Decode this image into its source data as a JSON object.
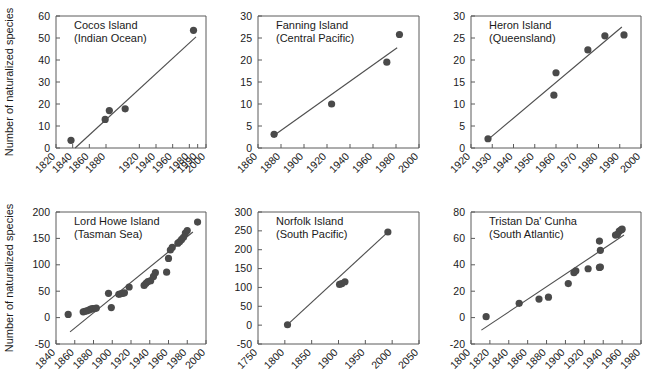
{
  "figure": {
    "shared_ylabel": "Number of naturalized species",
    "marker_color": "#4a4a4a",
    "line_color": "#4f4f4f",
    "axis_color": "#5a5a5a"
  },
  "chart_data": [
    {
      "type": "scatter",
      "panel": 1,
      "title": "Cocos Island",
      "subtitle": "(Indian Ocean)",
      "xlabel": "",
      "ylabel": "Number of naturalized species",
      "xlim": [
        1820,
        2000
      ],
      "ylim": [
        0,
        60
      ],
      "xticks": [
        1820,
        1840,
        1860,
        1880,
        1990,
        1920,
        1940,
        1960,
        1980,
        2000
      ],
      "xtick_labels": [
        "1820",
        "1840",
        "1860",
        "1880",
        "1990",
        "1920",
        "1940",
        "1960",
        "1980",
        "2000"
      ],
      "yticks": [
        0,
        10,
        20,
        30,
        40,
        50,
        60
      ],
      "ytick_labels": [
        "0",
        "10",
        "20",
        "30",
        "40",
        "50",
        "60"
      ],
      "grid": false,
      "legend": "none",
      "points": [
        {
          "x": 1838,
          "y": 3.5
        },
        {
          "x": 1879,
          "y": 13
        },
        {
          "x": 1884,
          "y": 17
        },
        {
          "x": 1903,
          "y": 17.8
        },
        {
          "x": 1985,
          "y": 53.5
        }
      ],
      "fit_line": {
        "x1": 1843,
        "y1": 0,
        "x2": 1988,
        "y2": 50.5
      }
    },
    {
      "type": "scatter",
      "panel": 2,
      "title": "Fanning Island",
      "subtitle": "(Central Pacific)",
      "xlabel": "",
      "ylabel": "",
      "xlim": [
        1860,
        2000
      ],
      "ylim": [
        0,
        30
      ],
      "xticks": [
        1860,
        1880,
        1900,
        1920,
        1940,
        1960,
        1980,
        2000
      ],
      "xtick_labels": [
        "1860",
        "1880",
        "1900",
        "1920",
        "1940",
        "1960",
        "1980",
        "2000"
      ],
      "yticks": [
        0,
        5,
        10,
        15,
        20,
        25,
        30
      ],
      "ytick_labels": [
        "0",
        "5",
        "10",
        "15",
        "20",
        "25",
        "30"
      ],
      "grid": false,
      "legend": "none",
      "points": [
        {
          "x": 1874,
          "y": 3.1
        },
        {
          "x": 1924,
          "y": 10.0
        },
        {
          "x": 1972,
          "y": 19.5
        },
        {
          "x": 1983,
          "y": 25.8
        }
      ],
      "fit_line": {
        "x1": 1872,
        "y1": 2.5,
        "x2": 1981,
        "y2": 22.8
      }
    },
    {
      "type": "scatter",
      "panel": 3,
      "title": "Heron Island",
      "subtitle": "(Queensland)",
      "xlabel": "",
      "ylabel": "",
      "xlim": [
        1920,
        2000
      ],
      "ylim": [
        0,
        30
      ],
      "xticks": [
        1920,
        1930,
        1940,
        1950,
        1960,
        1970,
        1980,
        1990,
        2000
      ],
      "xtick_labels": [
        "1920",
        "1930",
        "1940",
        "1950",
        "1960",
        "1970",
        "1980",
        "1990",
        "2000"
      ],
      "yticks": [
        0,
        5,
        10,
        15,
        20,
        25,
        30
      ],
      "ytick_labels": [
        "0",
        "5",
        "10",
        "15",
        "20",
        "25",
        "30"
      ],
      "grid": false,
      "legend": "none",
      "points": [
        {
          "x": 1928,
          "y": 2.1
        },
        {
          "x": 1959,
          "y": 12.0
        },
        {
          "x": 1960,
          "y": 17.1
        },
        {
          "x": 1975,
          "y": 22.3
        },
        {
          "x": 1983,
          "y": 25.5
        },
        {
          "x": 1992,
          "y": 25.7
        }
      ],
      "fit_line": {
        "x1": 1927,
        "y1": 1.5,
        "x2": 1991,
        "y2": 27.5
      }
    },
    {
      "type": "scatter",
      "panel": 4,
      "title": "Lord Howe Island",
      "subtitle": "(Tasman Sea)",
      "xlabel": "",
      "ylabel": "Number of naturalized species",
      "xlim": [
        1840,
        2000
      ],
      "ylim": [
        -50,
        200
      ],
      "xticks": [
        1840,
        1860,
        1880,
        1900,
        1920,
        1940,
        1960,
        1980,
        2000
      ],
      "xtick_labels": [
        "1840",
        "1860",
        "1880",
        "1900",
        "1920",
        "1940",
        "1960",
        "1980",
        "2000"
      ],
      "yticks": [
        -50,
        0,
        50,
        100,
        150,
        200
      ],
      "ytick_labels": [
        "-50",
        "0",
        "50",
        "100",
        "150",
        "200"
      ],
      "grid": false,
      "legend": "none",
      "points": [
        {
          "x": 1853,
          "y": 6
        },
        {
          "x": 1869,
          "y": 11
        },
        {
          "x": 1871,
          "y": 12
        },
        {
          "x": 1873,
          "y": 13
        },
        {
          "x": 1875,
          "y": 14
        },
        {
          "x": 1877,
          "y": 16
        },
        {
          "x": 1879,
          "y": 17
        },
        {
          "x": 1881,
          "y": 17
        },
        {
          "x": 1883,
          "y": 18
        },
        {
          "x": 1896,
          "y": 46
        },
        {
          "x": 1899,
          "y": 19
        },
        {
          "x": 1907,
          "y": 44
        },
        {
          "x": 1909,
          "y": 45
        },
        {
          "x": 1911,
          "y": 46
        },
        {
          "x": 1913,
          "y": 47
        },
        {
          "x": 1918,
          "y": 58
        },
        {
          "x": 1934,
          "y": 61
        },
        {
          "x": 1936,
          "y": 65
        },
        {
          "x": 1938,
          "y": 68
        },
        {
          "x": 1941,
          "y": 70
        },
        {
          "x": 1944,
          "y": 78
        },
        {
          "x": 1946,
          "y": 85
        },
        {
          "x": 1958,
          "y": 86
        },
        {
          "x": 1960,
          "y": 112
        },
        {
          "x": 1962,
          "y": 128
        },
        {
          "x": 1964,
          "y": 133
        },
        {
          "x": 1970,
          "y": 141
        },
        {
          "x": 1972,
          "y": 144
        },
        {
          "x": 1974,
          "y": 148
        },
        {
          "x": 1976,
          "y": 152
        },
        {
          "x": 1978,
          "y": 160
        },
        {
          "x": 1980,
          "y": 165
        },
        {
          "x": 1991,
          "y": 181
        }
      ],
      "fit_line": {
        "x1": 1855,
        "y1": -27,
        "x2": 1986,
        "y2": 162
      }
    },
    {
      "type": "scatter",
      "panel": 5,
      "title": "Norfolk Island",
      "subtitle": "(South Pacific)",
      "xlabel": "",
      "ylabel": "",
      "xlim": [
        1750,
        2050
      ],
      "ylim": [
        -50,
        300
      ],
      "xticks": [
        1750,
        1800,
        1850,
        1900,
        1950,
        2000,
        2050
      ],
      "xtick_labels": [
        "1750",
        "1800",
        "1850",
        "1900",
        "1950",
        "2000",
        "2050"
      ],
      "yticks": [
        -50,
        0,
        50,
        100,
        150,
        200,
        250,
        300
      ],
      "ytick_labels": [
        "-50",
        "0",
        "50",
        "100",
        "150",
        "200",
        "250",
        "300"
      ],
      "grid": false,
      "legend": "none",
      "points": [
        {
          "x": 1805,
          "y": 1
        },
        {
          "x": 1902,
          "y": 108
        },
        {
          "x": 1906,
          "y": 110
        },
        {
          "x": 1912,
          "y": 115
        },
        {
          "x": 1992,
          "y": 247
        }
      ],
      "fit_line": {
        "x1": 1804,
        "y1": 0,
        "x2": 1993,
        "y2": 248
      }
    },
    {
      "type": "scatter",
      "panel": 6,
      "title": "Tristan Da' Cunha",
      "subtitle": "(South Atlantic)",
      "xlabel": "",
      "ylabel": "",
      "xlim": [
        1800,
        1980
      ],
      "ylim": [
        -20,
        80
      ],
      "xticks": [
        1800,
        1820,
        1840,
        1860,
        1880,
        1900,
        1920,
        1940,
        1960,
        1980
      ],
      "xtick_labels": [
        "1800",
        "1820",
        "1840",
        "1860",
        "1880",
        "1900",
        "1920",
        "1940",
        "1960",
        "1980"
      ],
      "yticks": [
        -20,
        0,
        20,
        40,
        60,
        80
      ],
      "ytick_labels": [
        "-20",
        "0",
        "20",
        "40",
        "60",
        "80"
      ],
      "grid": false,
      "legend": "none",
      "points": [
        {
          "x": 1816,
          "y": 0.7
        },
        {
          "x": 1851,
          "y": 10.8
        },
        {
          "x": 1872,
          "y": 14.0
        },
        {
          "x": 1882,
          "y": 15.5
        },
        {
          "x": 1903,
          "y": 25.8
        },
        {
          "x": 1909,
          "y": 34.0
        },
        {
          "x": 1911,
          "y": 35.5
        },
        {
          "x": 1924,
          "y": 37.0
        },
        {
          "x": 1936,
          "y": 38.0
        },
        {
          "x": 1937,
          "y": 38.3
        },
        {
          "x": 1936,
          "y": 58.0
        },
        {
          "x": 1937,
          "y": 51.0
        },
        {
          "x": 1953,
          "y": 62.5
        },
        {
          "x": 1955,
          "y": 63.0
        },
        {
          "x": 1957,
          "y": 65.5
        },
        {
          "x": 1959,
          "y": 66.5
        },
        {
          "x": 1960,
          "y": 67.0
        }
      ],
      "fit_line": {
        "x1": 1811,
        "y1": -9.5,
        "x2": 1962,
        "y2": 62.5
      }
    }
  ]
}
